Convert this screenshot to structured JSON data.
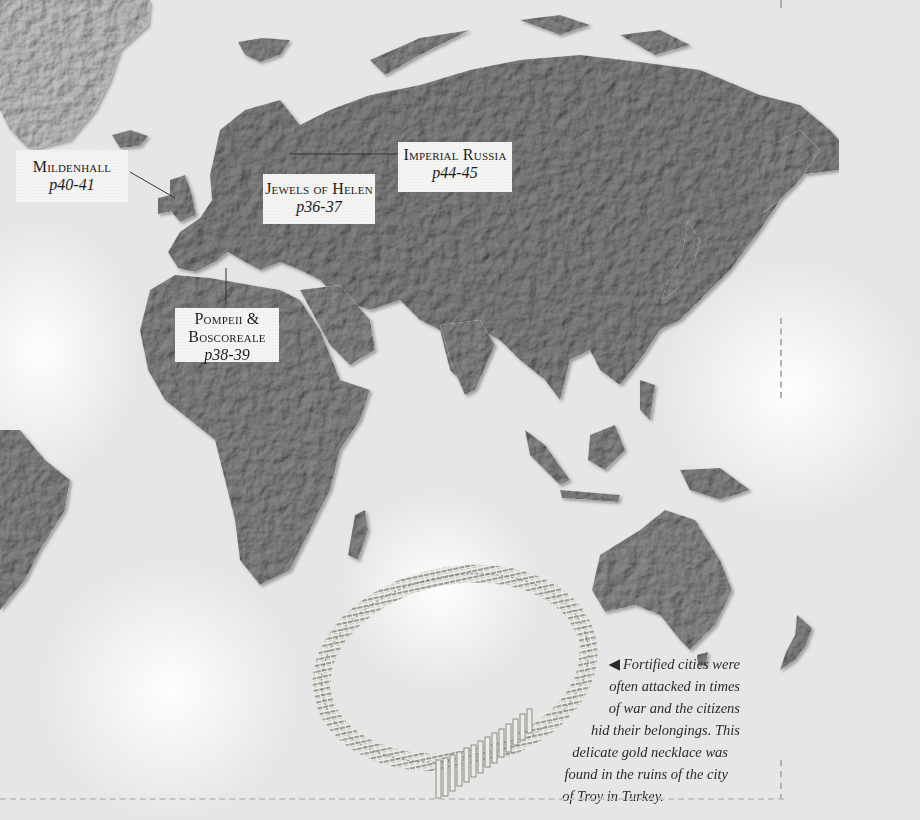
{
  "map": {
    "title": "World relief map (Eurasia, Africa, Australia)",
    "colors": {
      "ocean": "#e6e6e6",
      "land": "#8a8a8a",
      "land_dark": "#6e6e6e",
      "greenland": "#c9c9c9",
      "label_bg": "#f4f4f2",
      "text": "#1c1c1c"
    }
  },
  "labels": [
    {
      "id": "mildenhall",
      "title": "Mildenhall",
      "page": "p40-41"
    },
    {
      "id": "jewels-of-helen",
      "title": "Jewels of Helen",
      "page": "p36-37"
    },
    {
      "id": "imperial-russia",
      "title": "Imperial Russia",
      "page": "p44-45"
    },
    {
      "id": "pompeii-boscoreale",
      "title_line1": "Pompeii &",
      "title_line2": "Boscoreale",
      "page": "p38-39"
    }
  ],
  "caption": {
    "arrow": "◀",
    "lines": [
      "Fortified cities were",
      "often attacked in times",
      "of war and the citizens",
      "hid their belongings. This",
      "delicate gold necklace was",
      "found in the ruins of the city",
      "of Troy in Turkey."
    ]
  },
  "image": {
    "subject": "gold necklace from Troy"
  }
}
